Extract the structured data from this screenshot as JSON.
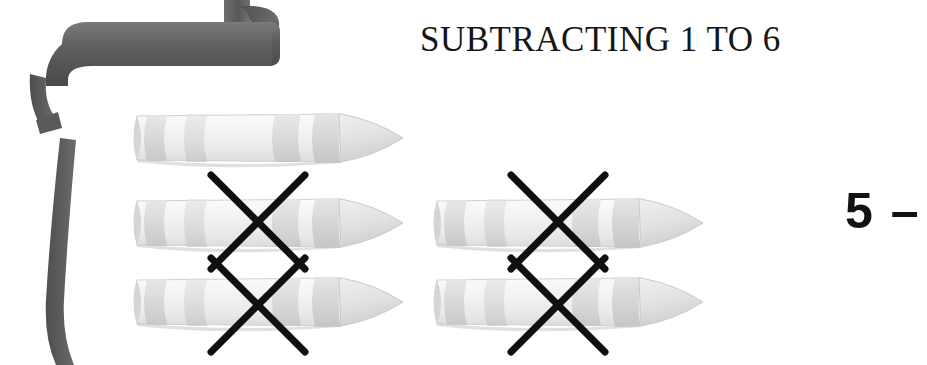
{
  "page": {
    "title": "SUBTRACTING 1 TO 6",
    "background_color": "#ffffff"
  },
  "decoration": {
    "ribbon": {
      "name": "ribbon-banner",
      "color_dark": "#4e4e4e",
      "color_mid": "#5f5f5f",
      "color_light": "#767676"
    }
  },
  "manipulatives": {
    "object_name": "crayon",
    "body_color": "#f2f2f2",
    "band_color": "#d9d9d9",
    "outline_color": "#c9c9c9",
    "tip_color": "#e6e6e6",
    "cross_color": "#101010",
    "total_shown": 5,
    "crossed_out": 4,
    "remaining": 1,
    "rows": [
      {
        "row_label": "row-1",
        "cells": [
          {
            "present": true,
            "crossed": false
          },
          {
            "present": false,
            "crossed": false
          }
        ]
      },
      {
        "row_label": "row-2",
        "cells": [
          {
            "present": true,
            "crossed": true
          },
          {
            "present": true,
            "crossed": true
          }
        ]
      },
      {
        "row_label": "row-3",
        "cells": [
          {
            "present": true,
            "crossed": true
          },
          {
            "present": true,
            "crossed": true
          }
        ]
      }
    ]
  },
  "equation": {
    "minuend": "5",
    "operator": "–",
    "subtrahend": "",
    "text_color": "#121212"
  }
}
